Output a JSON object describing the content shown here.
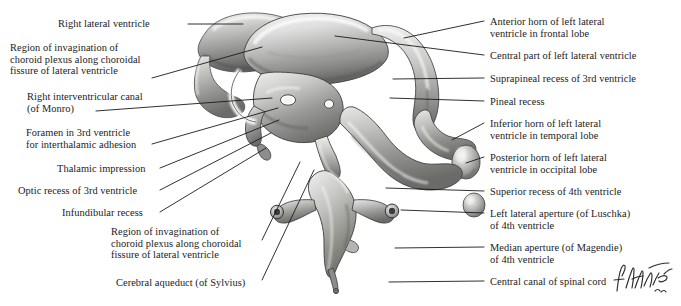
{
  "figure": {
    "artist_signature": "F. Netter",
    "background_color": "#ffffff",
    "text_color": "#1b1b1b",
    "leader_color": "#1a1a1a"
  },
  "labels_left": [
    {
      "id": "right-lateral-ventricle",
      "lines": [
        "Right lateral ventricle"
      ],
      "x": 58,
      "y": 18,
      "align": "left",
      "leader": [
        [
          188,
          24
        ],
        [
          243,
          24
        ]
      ]
    },
    {
      "id": "region-invagination-choroid-plexus-upper",
      "lines": [
        "Region of invagination of",
        "choroid plexus along choroidal",
        "fissure of lateral ventricle"
      ],
      "x": 10,
      "y": 42,
      "align": "left",
      "leader": [
        [
          152,
          78
        ],
        [
          262,
          47
        ]
      ]
    },
    {
      "id": "right-interventricular-canal-of-monro",
      "lines": [
        "Right interventricular canal",
        "(of Monro)"
      ],
      "x": 27,
      "y": 91,
      "align": "left",
      "leader": [
        [
          96,
          111
        ],
        [
          272,
          98
        ]
      ]
    },
    {
      "id": "foramen-3rd-ventricle-interthalamic-adhesion",
      "lines": [
        "Foramen in 3rd ventricle",
        "for interthalamic adhesion"
      ],
      "x": 26,
      "y": 127,
      "align": "left",
      "leader": [
        [
          152,
          144
        ],
        [
          278,
          108
        ]
      ]
    },
    {
      "id": "thalamic-impression",
      "lines": [
        "Thalamic impression"
      ],
      "x": 57,
      "y": 163,
      "align": "left",
      "leader": [
        [
          160,
          168
        ],
        [
          279,
          120
        ]
      ]
    },
    {
      "id": "optic-recess-3rd-ventricle",
      "lines": [
        "Optic recess of 3rd ventricle"
      ],
      "x": 18,
      "y": 185,
      "align": "left",
      "leader": [
        [
          160,
          190
        ],
        [
          271,
          133
        ]
      ]
    },
    {
      "id": "infundibular-recess",
      "lines": [
        "Infundibular recess"
      ],
      "x": 62,
      "y": 207,
      "align": "left",
      "leader": [
        [
          160,
          212
        ],
        [
          266,
          148
        ]
      ]
    },
    {
      "id": "region-invagination-choroid-plexus-lower",
      "lines": [
        "Region of invagination of",
        "choroid plexus along choroidal",
        "fissure of lateral ventricle"
      ],
      "x": 111,
      "y": 226,
      "align": "left",
      "leader": [
        [
          262,
          240
        ],
        [
          300,
          162
        ]
      ]
    },
    {
      "id": "cerebral-aqueduct-of-sylvius",
      "lines": [
        "Cerebral aqueduct (of Sylvius)"
      ],
      "x": 116,
      "y": 277,
      "align": "left",
      "leader": [
        [
          262,
          280
        ],
        [
          314,
          170
        ]
      ]
    }
  ],
  "labels_right": [
    {
      "id": "anterior-horn-left-lateral-ventricle-frontal-lobe",
      "lines": [
        "Anterior horn of left lateral",
        "ventricle in frontal lobe"
      ],
      "x": 490,
      "y": 16,
      "align": "left",
      "leader": [
        [
          484,
          21
        ],
        [
          404,
          38
        ]
      ]
    },
    {
      "id": "central-part-left-lateral-ventricle",
      "lines": [
        "Central part of left lateral ventricle"
      ],
      "x": 490,
      "y": 50,
      "align": "left",
      "leader": [
        [
          484,
          55
        ],
        [
          335,
          36
        ]
      ]
    },
    {
      "id": "suprapineal-recess-3rd-ventricle",
      "lines": [
        "Suprapineal recess of 3rd ventricle"
      ],
      "x": 490,
      "y": 73,
      "align": "left",
      "leader": [
        [
          484,
          78
        ],
        [
          393,
          79
        ]
      ]
    },
    {
      "id": "pineal-recess",
      "lines": [
        "Pineal recess"
      ],
      "x": 490,
      "y": 96,
      "align": "left",
      "leader": [
        [
          484,
          101
        ],
        [
          390,
          98
        ]
      ]
    },
    {
      "id": "inferior-horn-left-lateral-ventricle-temporal-lobe",
      "lines": [
        "Inferior horn of left lateral",
        "ventricle in temporal lobe"
      ],
      "x": 490,
      "y": 118,
      "align": "left",
      "leader": [
        [
          484,
          123
        ],
        [
          452,
          140
        ]
      ]
    },
    {
      "id": "posterior-horn-left-lateral-ventricle-occipital-lobe",
      "lines": [
        "Posterior horn of left lateral",
        "ventricle in occipital lobe"
      ],
      "x": 490,
      "y": 152,
      "align": "left",
      "leader": [
        [
          484,
          157
        ],
        [
          466,
          163
        ]
      ]
    },
    {
      "id": "superior-recess-4th-ventricle",
      "lines": [
        "Superior recess of 4th ventricle"
      ],
      "x": 490,
      "y": 186,
      "align": "left",
      "leader": [
        [
          484,
          191
        ],
        [
          386,
          188
        ]
      ]
    },
    {
      "id": "left-lateral-aperture-of-luschka-4th-ventricle",
      "lines": [
        "Left lateral aperture (of Luschka)",
        "of 4th ventricle"
      ],
      "x": 490,
      "y": 208,
      "align": "left",
      "leader": [
        [
          484,
          213
        ],
        [
          401,
          210
        ]
      ]
    },
    {
      "id": "median-aperture-of-magendie-4th-ventricle",
      "lines": [
        "Median aperture (of Magendie)",
        "of 4th ventricle"
      ],
      "x": 490,
      "y": 242,
      "align": "left",
      "leader": [
        [
          484,
          247
        ],
        [
          395,
          248
        ]
      ]
    },
    {
      "id": "central-canal-of-spinal-cord",
      "lines": [
        "Central canal of spinal cord"
      ],
      "x": 490,
      "y": 276,
      "align": "left",
      "leader": [
        [
          484,
          281
        ],
        [
          389,
          282
        ]
      ]
    }
  ]
}
